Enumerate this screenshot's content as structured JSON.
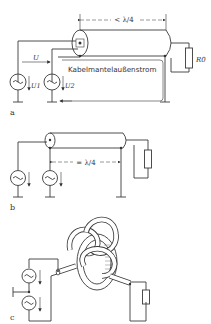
{
  "figure": {
    "panels": [
      {
        "id": "a",
        "label": "a",
        "length_label": "< λ/4",
        "current_label": "Kabelmantelaußenstrom",
        "voltage_total": "U",
        "voltage_1": "U1",
        "voltage_2": "U2",
        "load_label": "R0",
        "sources": [
          "ac-source",
          "ac-source"
        ]
      },
      {
        "id": "b",
        "label": "b",
        "length_label": "= λ/4",
        "sources": [
          "ac-source",
          "ac-source"
        ]
      },
      {
        "id": "c",
        "label": "c",
        "description": "coaxial cable coiled/knotted as choke",
        "sources": [
          "ac-source",
          "ac-source"
        ]
      }
    ],
    "colors": {
      "line": "#3a3a3a",
      "background": "#ffffff"
    }
  }
}
